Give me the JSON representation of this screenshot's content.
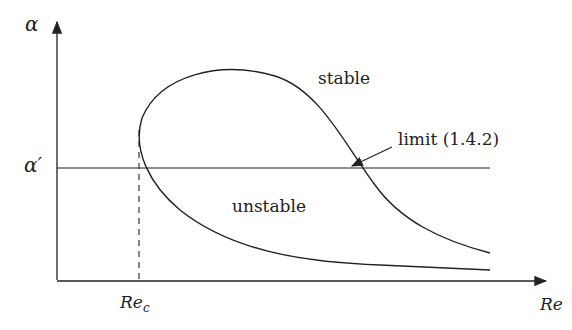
{
  "diagram": {
    "y_axis_label": "α",
    "x_axis_label": "Re",
    "alpha_prime_label": "α′",
    "re_c_label": "Re",
    "re_c_subscript": "c",
    "region_stable": "stable",
    "region_unstable": "unstable",
    "limit_label": "limit (1.4.2)",
    "line_color": "#222222"
  }
}
